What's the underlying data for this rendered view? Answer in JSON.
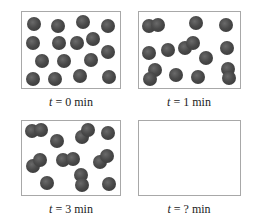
{
  "figure": {
    "panels": [
      {
        "id": "t0",
        "label_var": "t",
        "label_eq": " = ",
        "label_value": "0 min",
        "box": {
          "x": 21,
          "y": 11,
          "w": 100,
          "h": 78
        },
        "label_pos": {
          "x": 71,
          "y": 95
        },
        "sphere_color": "#4a4a4a",
        "monomers": 16,
        "dimers": 0,
        "spheres": [
          [
            34,
            24
          ],
          [
            58,
            26
          ],
          [
            83,
            22
          ],
          [
            108,
            26
          ],
          [
            33,
            43
          ],
          [
            59,
            43
          ],
          [
            77,
            43
          ],
          [
            93,
            39
          ],
          [
            42,
            61
          ],
          [
            64,
            61
          ],
          [
            91,
            60
          ],
          [
            108,
            52
          ],
          [
            33,
            79
          ],
          [
            55,
            79
          ],
          [
            80,
            76
          ],
          [
            109,
            77
          ]
        ]
      },
      {
        "id": "t1",
        "label_var": "t",
        "label_eq": " = ",
        "label_value": "1 min",
        "box": {
          "x": 138,
          "y": 11,
          "w": 103,
          "h": 78
        },
        "label_pos": {
          "x": 189,
          "y": 95
        },
        "sphere_color": "#4a4a4a",
        "monomers": 8,
        "dimers": 4,
        "spheres": [
          [
            149,
            26
          ],
          [
            158,
            25
          ],
          [
            196,
            23
          ],
          [
            226,
            25
          ],
          [
            149,
            53
          ],
          [
            168,
            50
          ],
          [
            185,
            48
          ],
          [
            193,
            43
          ],
          [
            206,
            58
          ],
          [
            227,
            48
          ],
          [
            155,
            70
          ],
          [
            150,
            79
          ],
          [
            176,
            75
          ],
          [
            198,
            77
          ],
          [
            228,
            69
          ],
          [
            229,
            78
          ]
        ]
      },
      {
        "id": "t3",
        "label_var": "t",
        "label_eq": " = ",
        "label_value": "3 min",
        "box": {
          "x": 21,
          "y": 120,
          "w": 100,
          "h": 76
        },
        "label_pos": {
          "x": 71,
          "y": 202
        },
        "sphere_color": "#4a4a4a",
        "monomers": 4,
        "dimers": 6,
        "spheres": [
          [
            32,
            131
          ],
          [
            41,
            130
          ],
          [
            57,
            141
          ],
          [
            82,
            137
          ],
          [
            88,
            130
          ],
          [
            108,
            133
          ],
          [
            33,
            166
          ],
          [
            40,
            160
          ],
          [
            63,
            160
          ],
          [
            73,
            159
          ],
          [
            100,
            162
          ],
          [
            107,
            156
          ],
          [
            47,
            183
          ],
          [
            81,
            175
          ],
          [
            82,
            185
          ],
          [
            109,
            184
          ]
        ]
      },
      {
        "id": "t_unknown",
        "label_var": "t",
        "label_eq": " = ",
        "label_value": "? min",
        "box": {
          "x": 138,
          "y": 120,
          "w": 103,
          "h": 76
        },
        "label_pos": {
          "x": 189,
          "y": 202
        },
        "sphere_color": "#4a4a4a",
        "monomers": null,
        "dimers": null,
        "spheres": []
      }
    ],
    "sphere_radius": 7
  }
}
